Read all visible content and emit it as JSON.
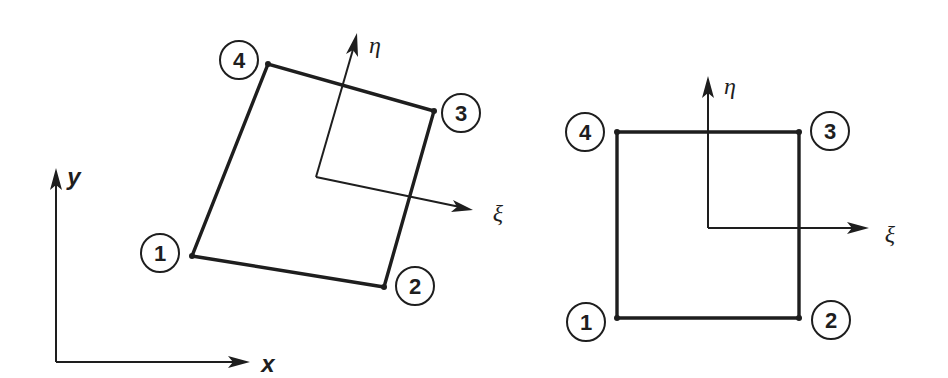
{
  "figure": {
    "global_axes": {
      "x_label": "x",
      "y_label": "y"
    },
    "physical_element": {
      "title": "Distorted quadrilateral in global coordinates",
      "node_labels": [
        "1",
        "2",
        "3",
        "4"
      ],
      "local_axes": {
        "xi_label": "ξ",
        "eta_label": "η"
      }
    },
    "parent_element": {
      "title": "Square parent element in natural coordinates",
      "node_labels": [
        "1",
        "2",
        "3",
        "4"
      ],
      "local_axes": {
        "xi_label": "ξ",
        "eta_label": "η"
      }
    },
    "colors": {
      "ink": "#1e1e1e",
      "background": "#ffffff"
    }
  }
}
